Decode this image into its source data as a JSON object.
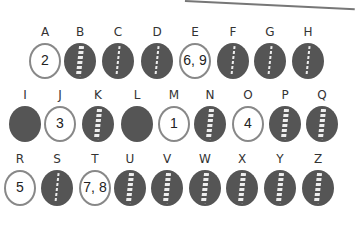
{
  "colors": {
    "disc_dark": "#555555",
    "disc_light": "#ffffff",
    "crack": "#eeeeee"
  },
  "rows": [
    {
      "top": 25,
      "items": [
        {
          "letter": "A",
          "x": 25,
          "type": "light",
          "number": "2"
        },
        {
          "letter": "B",
          "x": 60,
          "type": "dark",
          "crack": "wide"
        },
        {
          "letter": "C",
          "x": 98,
          "type": "dark",
          "crack": "thin"
        },
        {
          "letter": "D",
          "x": 137,
          "type": "dark",
          "crack": "thin"
        },
        {
          "letter": "E",
          "x": 175,
          "type": "light",
          "number": "6, 9"
        },
        {
          "letter": "F",
          "x": 213,
          "type": "dark",
          "crack": "thin"
        },
        {
          "letter": "G",
          "x": 250,
          "type": "dark",
          "crack": "thin"
        },
        {
          "letter": "H",
          "x": 288,
          "type": "dark",
          "crack": "thin"
        }
      ]
    },
    {
      "top": 88,
      "items": [
        {
          "letter": "I",
          "x": 5,
          "type": "dark",
          "crack": "none"
        },
        {
          "letter": "J",
          "x": 40,
          "type": "light",
          "number": "3"
        },
        {
          "letter": "K",
          "x": 78,
          "type": "dark",
          "crack": "wide"
        },
        {
          "letter": "L",
          "x": 117,
          "type": "dark",
          "crack": "none"
        },
        {
          "letter": "M",
          "x": 154,
          "type": "light",
          "number": "1"
        },
        {
          "letter": "N",
          "x": 190,
          "type": "dark",
          "crack": "wide"
        },
        {
          "letter": "O",
          "x": 228,
          "type": "light",
          "number": "4"
        },
        {
          "letter": "P",
          "x": 265,
          "type": "dark",
          "crack": "wide"
        },
        {
          "letter": "Q",
          "x": 302,
          "type": "dark",
          "crack": "wide"
        }
      ]
    },
    {
      "top": 152,
      "items": [
        {
          "letter": "R",
          "x": 0,
          "type": "light",
          "number": "5"
        },
        {
          "letter": "S",
          "x": 37,
          "type": "dark",
          "crack": "thin"
        },
        {
          "letter": "T",
          "x": 75,
          "type": "light",
          "number": "7, 8"
        },
        {
          "letter": "U",
          "x": 110,
          "type": "dark",
          "crack": "wide"
        },
        {
          "letter": "V",
          "x": 147,
          "type": "dark",
          "crack": "wide"
        },
        {
          "letter": "W",
          "x": 185,
          "type": "dark",
          "crack": "wide"
        },
        {
          "letter": "X",
          "x": 222,
          "type": "dark",
          "crack": "wide"
        },
        {
          "letter": "Y",
          "x": 260,
          "type": "dark",
          "crack": "wide"
        },
        {
          "letter": "Z",
          "x": 298,
          "type": "dark",
          "crack": "wide"
        }
      ]
    }
  ]
}
